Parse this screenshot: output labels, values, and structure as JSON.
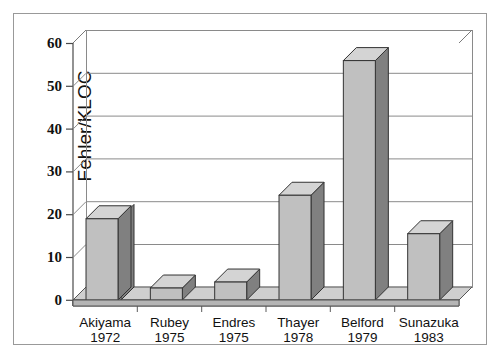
{
  "chart_data": {
    "type": "bar",
    "title": "",
    "subtitle": "",
    "xlabel": "",
    "ylabel": "Fehler/KLOC",
    "ylim": [
      0,
      60
    ],
    "yticks": [
      0,
      10,
      20,
      30,
      40,
      50,
      60
    ],
    "ytick_labels": [
      "0",
      "10",
      "20",
      "30",
      "40",
      "50",
      "60"
    ],
    "grid": true,
    "legend": null,
    "style": "3d-bar",
    "categories": [
      "Akiyama\n1972",
      "Rubey\n1975",
      "Endres\n1975",
      "Thayer\n1978",
      "Belford\n1979",
      "Sunazuka\n1983"
    ],
    "category_names": [
      "Akiyama",
      "Rubey",
      "Endres",
      "Thayer",
      "Belford",
      "Sunazuka"
    ],
    "category_years": [
      "1972",
      "1975",
      "1975",
      "1978",
      "1979",
      "1983"
    ],
    "values": [
      19,
      2.8,
      4.2,
      24.5,
      56,
      15.5
    ],
    "series": [
      {
        "name": "Fehler/KLOC",
        "values": [
          19,
          2.8,
          4.2,
          24.5,
          56,
          15.5
        ]
      }
    ]
  },
  "axis": {
    "y_title": "Fehler/KLOC",
    "tick_0": "0",
    "tick_10": "10",
    "tick_20": "20",
    "tick_30": "30",
    "tick_40": "40",
    "tick_50": "50",
    "tick_60": "60"
  },
  "categories": [
    {
      "name": "Akiyama",
      "year": "1972",
      "value": 19
    },
    {
      "name": "Rubey",
      "year": "1975",
      "value": 2.8
    },
    {
      "name": "Endres",
      "year": "1975",
      "value": 4.2
    },
    {
      "name": "Thayer",
      "year": "1978",
      "value": 24.5
    },
    {
      "name": "Belford",
      "year": "1979",
      "value": 56
    },
    {
      "name": "Sunazuka",
      "year": "1983",
      "value": 15.5
    }
  ],
  "colors": {
    "bar_front": "#c0c0c0",
    "bar_side": "#808080",
    "bar_top": "#d4d4d4",
    "bar_outline": "#333333",
    "grid": "#8a8a8a",
    "axis": "#4a4a4a",
    "floor_front": "#b5b5b5",
    "floor_top": "#cfcfcf",
    "background": "#ffffff",
    "text": "#111111",
    "frame": "#999999"
  }
}
